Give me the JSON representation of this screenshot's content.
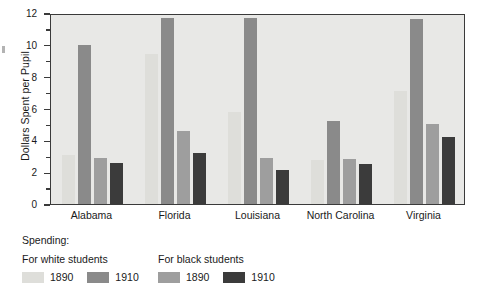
{
  "chart_data": {
    "type": "bar",
    "title": "",
    "xlabel": "",
    "ylabel": "Dollars Spent per Pupil",
    "ylim": [
      0,
      12
    ],
    "ytick_labels": [
      "0",
      "2",
      "4",
      "6",
      "8",
      "10",
      "12"
    ],
    "ytick_values": [
      0,
      2,
      4,
      6,
      8,
      10,
      12
    ],
    "yminor_values": [
      1,
      3,
      5,
      7,
      9,
      11
    ],
    "grid": false,
    "legend_position": "below-plot",
    "categories": [
      "Alabama",
      "Florida",
      "Louisiana",
      "North Carolina",
      "Virginia"
    ],
    "series": [
      {
        "name": "For white students 1890",
        "group": "For white students",
        "year": "1890",
        "color": "#dededa",
        "values": [
          3.1,
          9.4,
          5.8,
          2.75,
          7.1
        ]
      },
      {
        "name": "For white students 1910",
        "group": "For white students",
        "year": "1910",
        "color": "#8a8a8a",
        "values": [
          10.0,
          11.7,
          11.7,
          5.2,
          11.6
        ]
      },
      {
        "name": "For black students 1890",
        "group": "For black students",
        "year": "1890",
        "color": "#9e9e9e",
        "values": [
          2.9,
          4.6,
          2.9,
          2.85,
          5.0
        ]
      },
      {
        "name": "For black students 1910",
        "group": "For black students",
        "year": "1910",
        "color": "#3b3b3b",
        "values": [
          2.6,
          3.2,
          2.15,
          2.5,
          4.2
        ]
      }
    ]
  },
  "axis": {
    "y_title": "Dollars Spent per Pupil",
    "y_ticks": [
      "12",
      "10",
      "8",
      "6",
      "4",
      "2",
      "0"
    ]
  },
  "legend": {
    "title": "Spending:",
    "columns": [
      {
        "header": "For white students",
        "entries": [
          {
            "label": "1890",
            "color": "#dededa"
          },
          {
            "label": "1910",
            "color": "#8a8a8a"
          }
        ]
      },
      {
        "header": "For black students",
        "entries": [
          {
            "label": "1890",
            "color": "#9e9e9e"
          },
          {
            "label": "1910",
            "color": "#3b3b3b"
          }
        ]
      }
    ]
  },
  "colors": {
    "plot_background": "#e8e8e6",
    "frame": "#3a3a3a",
    "text": "#1a1a1a"
  }
}
